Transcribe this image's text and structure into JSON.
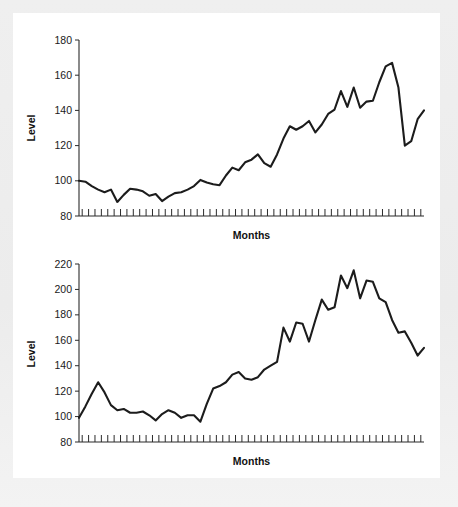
{
  "page": {
    "background_color": "#ebebeb",
    "panel_color": "#ffffff",
    "ink_color": "#1c1c1c"
  },
  "chart_data": [
    {
      "id": "chart-top",
      "type": "line",
      "title": "",
      "xlabel": "Months",
      "ylabel": "Level",
      "ylim": [
        80,
        180
      ],
      "yticks": [
        80,
        100,
        120,
        140,
        160,
        180
      ],
      "ytick_labels": [
        "80",
        "100",
        "120",
        "140",
        "160",
        "180"
      ],
      "xlim": [
        0,
        54
      ],
      "xtick_count": 54,
      "xtick_labels": [],
      "grid": false,
      "legend": false,
      "line_color": "#1c1c1c",
      "series": [
        {
          "name": "Level",
          "values": [
            100,
            99.5,
            97,
            95,
            93.5,
            95,
            88,
            92,
            95.5,
            95,
            94,
            91.5,
            92.5,
            88.5,
            91,
            93,
            93.5,
            95,
            97,
            100.5,
            99,
            98,
            97.5,
            103,
            107.5,
            106,
            110.5,
            112,
            115,
            110,
            108,
            115,
            124,
            131,
            129,
            131,
            134,
            127.5,
            132,
            138,
            140.5,
            151,
            142,
            153,
            141.5,
            145,
            145.5,
            156,
            165,
            167,
            153,
            120,
            122.5,
            135,
            140
          ]
        }
      ]
    },
    {
      "id": "chart-bottom",
      "type": "line",
      "title": "",
      "xlabel": "Months",
      "ylabel": "Level",
      "ylim": [
        80,
        220
      ],
      "yticks": [
        80,
        100,
        120,
        140,
        160,
        180,
        200,
        220
      ],
      "ytick_labels": [
        "80",
        "100",
        "120",
        "140",
        "160",
        "180",
        "200",
        "220"
      ],
      "xlim": [
        0,
        54
      ],
      "xtick_count": 54,
      "xtick_labels": [],
      "grid": false,
      "legend": false,
      "line_color": "#1c1c1c",
      "series": [
        {
          "name": "Level",
          "values": [
            99,
            108,
            118,
            127,
            119,
            109,
            105,
            106,
            103,
            103,
            104,
            101,
            97,
            102,
            105,
            103,
            99,
            101,
            101,
            96,
            110,
            122,
            124,
            127,
            133,
            135,
            130,
            129,
            131,
            137,
            140,
            143,
            170,
            159,
            174,
            173,
            159,
            176,
            192,
            184,
            186,
            211,
            201,
            215,
            193,
            207,
            206,
            193,
            190,
            176,
            166,
            167,
            158,
            148,
            154
          ]
        }
      ]
    }
  ],
  "labels": {
    "level": "Level",
    "months": "Months"
  }
}
